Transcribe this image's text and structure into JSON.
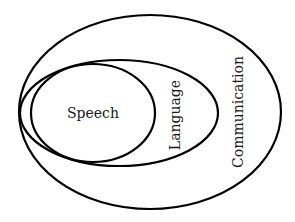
{
  "diagram": {
    "type": "nested-ellipse-venn",
    "stroke_color": "#000000",
    "background": "#ffffff",
    "sets": [
      {
        "id": "communication",
        "label": "Communication",
        "orientation": "vertical",
        "ellipse": {
          "cx": 150,
          "cy": 112,
          "rx": 131,
          "ry": 97
        },
        "label_pos": {
          "x": 239,
          "y": 112,
          "rotate": -90,
          "size": 14
        },
        "contains": [
          "language"
        ]
      },
      {
        "id": "language",
        "label": "Language",
        "orientation": "vertical",
        "ellipse": {
          "cx": 119,
          "cy": 113,
          "rx": 99,
          "ry": 53
        },
        "label_pos": {
          "x": 176,
          "y": 115,
          "rotate": -90,
          "size": 14
        },
        "contains": [
          "speech"
        ]
      },
      {
        "id": "speech",
        "label": "Speech",
        "orientation": "horizontal",
        "ellipse": {
          "cx": 93,
          "cy": 113,
          "rx": 62,
          "ry": 49
        },
        "label_pos": {
          "x": 93,
          "y": 118,
          "rotate": 0,
          "size": 14
        },
        "contains": []
      }
    ]
  }
}
